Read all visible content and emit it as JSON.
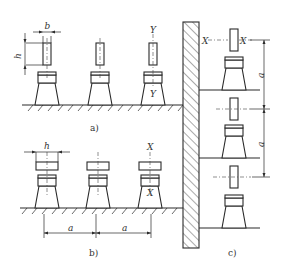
{
  "panels": {
    "a": {
      "caption": "a)",
      "dim_b": "b",
      "dim_h": "h",
      "axis_top": "Y",
      "axis_bottom": "Y"
    },
    "b": {
      "caption": "b)",
      "dim_h": "h",
      "dim_a1": "a",
      "dim_a2": "a",
      "axis_top": "X",
      "axis_bottom": "X"
    },
    "c": {
      "caption": "c)",
      "axis_left": "X",
      "axis_right": "X",
      "dim_a1": "a",
      "dim_a2": "a"
    }
  },
  "colors": {
    "line": "#2a2a2a",
    "background": "#ffffff"
  }
}
